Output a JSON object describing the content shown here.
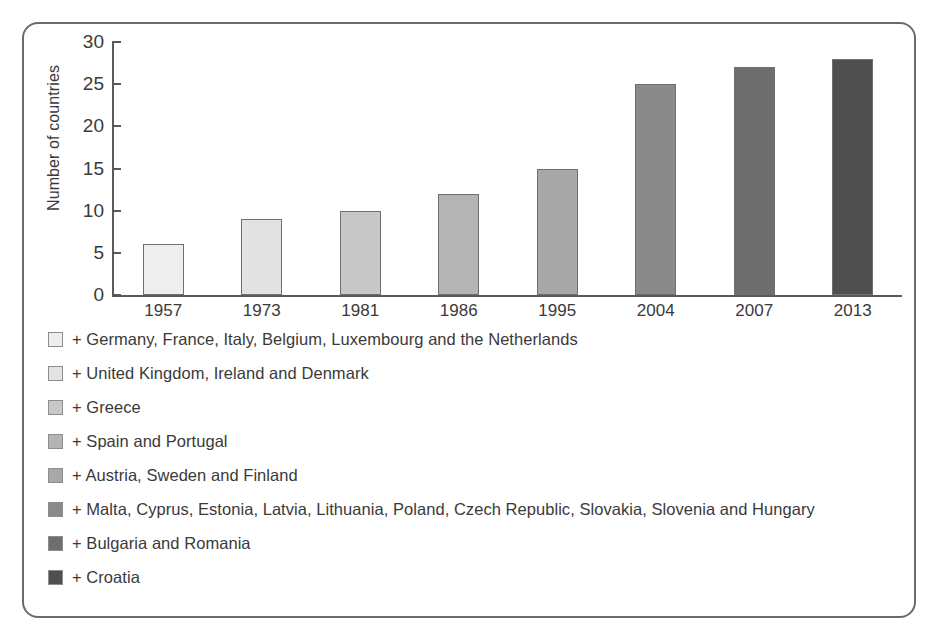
{
  "chart_data": {
    "type": "bar",
    "title": "",
    "xlabel": "",
    "ylabel": "Number of countries",
    "categories": [
      "1957",
      "1973",
      "1981",
      "1986",
      "1995",
      "2004",
      "2007",
      "2013"
    ],
    "values": [
      6,
      9,
      10,
      12,
      15,
      25,
      27,
      28
    ],
    "ylim": [
      0,
      30
    ],
    "yticks": [
      0,
      5,
      10,
      15,
      20,
      25,
      30
    ],
    "ytick_labels": [
      "0",
      "5",
      "10",
      "15",
      "20",
      "25",
      "30"
    ],
    "grid": false,
    "legend_position": "below",
    "bar_colors": [
      "#eeeeee",
      "#e2e2e2",
      "#c8c8c8",
      "#b4b4b4",
      "#a8a8a8",
      "#8a8a8a",
      "#6e6e6e",
      "#4f4f4f"
    ],
    "bar_border_color": "#6f6f6f",
    "axis_color": "#5a5a5a",
    "text_color": "#3a3a3a",
    "frame_color": "#6b6b6b",
    "legend": [
      {
        "swatch": "#eeeeee",
        "label": "+ Germany, France, Italy, Belgium, Luxembourg and the Netherlands"
      },
      {
        "swatch": "#e2e2e2",
        "label": "+ United Kingdom, Ireland and Denmark"
      },
      {
        "swatch": "#c8c8c8",
        "label": "+ Greece"
      },
      {
        "swatch": "#b4b4b4",
        "label": "+ Spain and Portugal"
      },
      {
        "swatch": "#a8a8a8",
        "label": "+ Austria, Sweden and Finland"
      },
      {
        "swatch": "#8a8a8a",
        "label": "+ Malta, Cyprus, Estonia, Latvia, Lithuania, Poland, Czech Republic, Slovakia, Slovenia and Hungary"
      },
      {
        "swatch": "#6e6e6e",
        "label": "+ Bulgaria and Romania"
      },
      {
        "swatch": "#4f4f4f",
        "label": "+ Croatia"
      }
    ]
  }
}
